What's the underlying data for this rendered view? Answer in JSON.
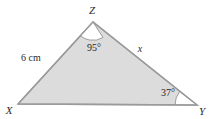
{
  "figure": {
    "type": "geometry-diagram",
    "shape": "triangle",
    "background_color": "#ffffff",
    "fill_color": "#dcdcdc",
    "stroke_color": "#9a9a9a",
    "arc_fill_color": "#ffffff",
    "text_color": "#2b2b2b",
    "vertices": [
      {
        "name": "X",
        "label": "X",
        "x": 18,
        "y": 104
      },
      {
        "name": "Y",
        "label": "Y",
        "x": 197,
        "y": 105
      },
      {
        "name": "Z",
        "label": "Z",
        "x": 93,
        "y": 22
      }
    ],
    "vertex_labels": [
      {
        "name": "vertex-label-z",
        "text": "Z",
        "x": 92,
        "y": 14
      },
      {
        "name": "vertex-label-x",
        "text": "X",
        "x": 9,
        "y": 114
      },
      {
        "name": "vertex-label-y",
        "text": "Y",
        "x": 202,
        "y": 115
      }
    ],
    "side_labels": [
      {
        "name": "side-label-xz",
        "text": "6 cm",
        "x": 21,
        "y": 61,
        "side": "XZ",
        "value": 6,
        "unit": "cm"
      },
      {
        "name": "side-label-zy",
        "text": "x",
        "x": 140,
        "y": 52,
        "side": "ZY",
        "value": null,
        "unit": ""
      }
    ],
    "angle_labels": [
      {
        "name": "angle-label-z",
        "text": "95°",
        "value": 95,
        "at_vertex": "Z",
        "x": 87,
        "y": 51
      },
      {
        "name": "angle-label-y",
        "text": "37°",
        "value": 37,
        "at_vertex": "Y",
        "x": 161,
        "y": 96
      }
    ],
    "angle_arcs": [
      {
        "name": "angle-arc-z",
        "at_vertex": "Z",
        "radius": 18
      },
      {
        "name": "angle-arc-y",
        "at_vertex": "Y",
        "radius": 22
      }
    ]
  }
}
